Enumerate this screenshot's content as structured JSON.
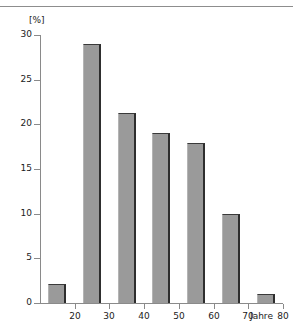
{
  "chart_data": {
    "type": "bar",
    "title": "",
    "subtitle": "",
    "xlabel": "Jahre",
    "ylabel": "[%]",
    "ylim": [
      0,
      30
    ],
    "xlim": [
      10,
      80
    ],
    "grid": false,
    "legend": null,
    "y_ticks": [
      "0",
      "5",
      "10",
      "15",
      "20",
      "25",
      "30"
    ],
    "y_tick_values": [
      0,
      5,
      10,
      15,
      20,
      25,
      30
    ],
    "x_ticks": [
      "20",
      "30",
      "40",
      "50",
      "60",
      "70",
      "80"
    ],
    "x_tick_values": [
      20,
      30,
      40,
      50,
      60,
      70,
      80
    ],
    "categories": [
      "10-20",
      "20-30",
      "30-40",
      "40-50",
      "50-60",
      "60-70",
      "70-80"
    ],
    "bin_edges": [
      10,
      20,
      30,
      40,
      50,
      60,
      70,
      80
    ],
    "values": [
      2.1,
      29.0,
      21.3,
      19.0,
      17.9,
      10.0,
      1.0
    ],
    "bar_color": "#9a9a9a",
    "bar_edge_color": "#2e2e2e",
    "axis_color": "#8a8a8a",
    "text_color": "#1b1b1b"
  },
  "axis": {
    "y_title": "[%]",
    "x_title": "Jahre"
  }
}
